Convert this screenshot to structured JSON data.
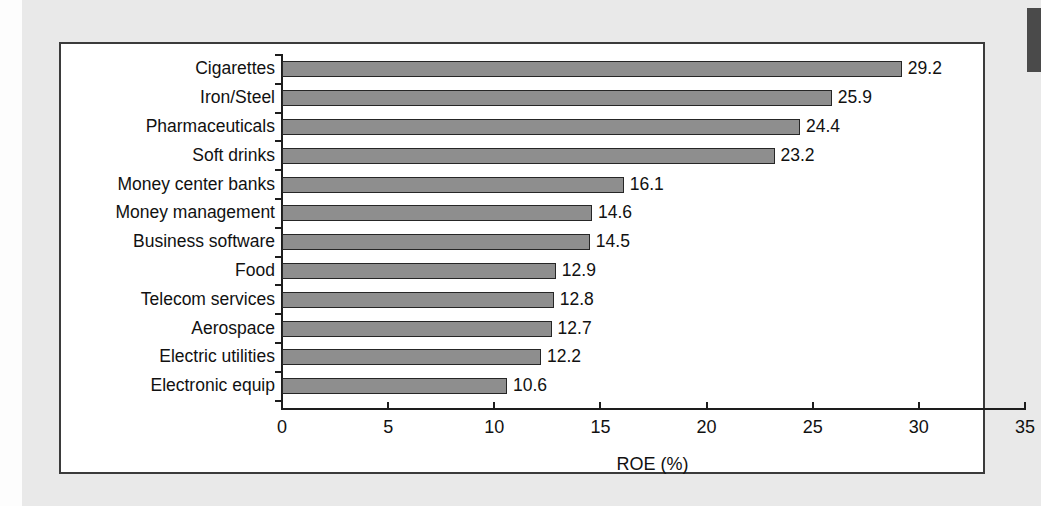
{
  "page": {
    "background_color": "#e9e9e9",
    "frame_color": "#3b3b3b",
    "bar_fill_color": "#8e8e8e",
    "bar_edge_color": "#262626"
  },
  "chart_data": {
    "type": "bar",
    "orientation": "horizontal",
    "title": "",
    "xlabel": "ROE (%)",
    "ylabel": "",
    "xlim": [
      0,
      35
    ],
    "xticks": [
      0,
      5,
      10,
      15,
      20,
      25,
      30,
      35
    ],
    "xtick_labels": [
      "0",
      "5",
      "10",
      "15",
      "20",
      "25",
      "30",
      "35"
    ],
    "grid": false,
    "legend": false,
    "categories": [
      "Cigarettes",
      "Iron/Steel",
      "Pharmaceuticals",
      "Soft drinks",
      "Money center banks",
      "Money management",
      "Business software",
      "Food",
      "Telecom services",
      "Aerospace",
      "Electric utilities",
      "Electronic equip"
    ],
    "values": [
      29.2,
      25.9,
      24.4,
      23.2,
      16.1,
      14.6,
      14.5,
      12.9,
      12.8,
      12.7,
      12.2,
      10.6
    ],
    "value_labels": [
      "29.2",
      "25.9",
      "24.4",
      "23.2",
      "16.1",
      "14.6",
      "14.5",
      "12.9",
      "12.8",
      "12.7",
      "12.2",
      "10.6"
    ]
  }
}
